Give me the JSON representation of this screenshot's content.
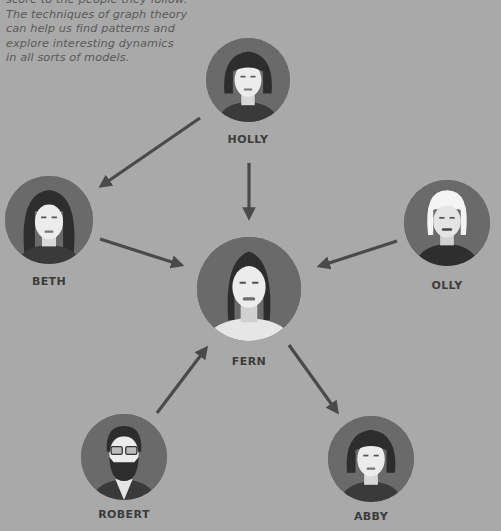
{
  "caption": {
    "lines": [
      "score to the people they follow.",
      "The techniques of graph theory",
      "can help us find patterns and",
      "explore interesting dynamics",
      "in all sorts of models."
    ]
  },
  "nodes": {
    "holly": {
      "label": "HOLLY"
    },
    "beth": {
      "label": "BETH"
    },
    "fern": {
      "label": "FERN"
    },
    "olly": {
      "label": "OLLY"
    },
    "robert": {
      "label": "ROBERT"
    },
    "abby": {
      "label": "ABBY"
    }
  },
  "edges": [
    {
      "from": "HOLLY",
      "to": "BETH"
    },
    {
      "from": "HOLLY",
      "to": "FERN"
    },
    {
      "from": "BETH",
      "to": "FERN"
    },
    {
      "from": "OLLY",
      "to": "FERN"
    },
    {
      "from": "ROBERT",
      "to": "FERN"
    },
    {
      "from": "FERN",
      "to": "ABBY"
    }
  ],
  "colors": {
    "background": "#a9a9a9",
    "circle": "#666666",
    "arrow": "#4a4a4a",
    "label": "#3c3c3c",
    "caption": "#5a5a5a"
  }
}
